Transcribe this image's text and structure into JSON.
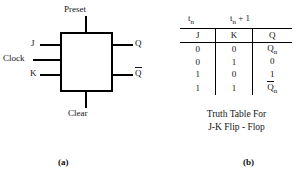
{
  "figure": {
    "panel_a": {
      "caption": "(a)",
      "device_name": "J-K Flip-Flop logic symbol",
      "pins": {
        "preset": "Preset",
        "clear": "Clear",
        "j": "J",
        "clock": "Clock",
        "k": "K",
        "q": "Q",
        "q_bar": "Q"
      }
    },
    "panel_b": {
      "caption": "(b)",
      "time_headers": {
        "present": {
          "base": "t",
          "sub": "n",
          "suffix": ""
        },
        "next": {
          "base": "t",
          "sub": "n",
          "suffix": " + 1"
        }
      },
      "columns": [
        "J",
        "K",
        "Q"
      ],
      "rows": [
        {
          "j": "0",
          "k": "0",
          "q": "Q",
          "q_sub": "n",
          "q_overbar": false
        },
        {
          "j": "0",
          "k": "1",
          "q": "0",
          "q_sub": "",
          "q_overbar": false
        },
        {
          "j": "1",
          "k": "0",
          "q": "1",
          "q_sub": "",
          "q_overbar": false
        },
        {
          "j": "1",
          "k": "1",
          "q": "Q",
          "q_sub": "n",
          "q_overbar": true
        }
      ],
      "caption_line1": "Truth Table For",
      "caption_line2": "J-K Flip - Flop"
    }
  },
  "colors": {
    "ink": "#151515",
    "line": "#000000",
    "background": "#ffffff"
  }
}
